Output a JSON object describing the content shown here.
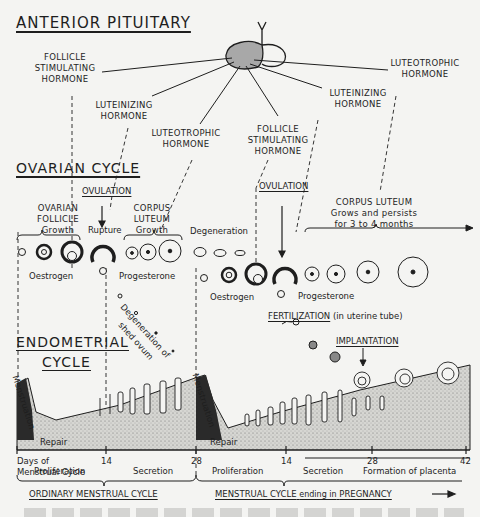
{
  "titles": {
    "anterior_pituitary": "ANTERIOR PITUITARY",
    "ovarian_cycle": "OVARIAN CYCLE",
    "endometrial_cycle_line1": "ENDOMETRIAL",
    "endometrial_cycle_line2": "CYCLE"
  },
  "hormones": {
    "fsh_1": [
      "FOLLICLE",
      "STIMULATING",
      "HORMONE"
    ],
    "lh_1": [
      "LUTEINIZING",
      "HORMONE"
    ],
    "ltr_1": [
      "LUTEOTROPHIC",
      "HORMONE"
    ],
    "fsh_2": [
      "FOLLICLE",
      "STIMULATING",
      "HORMONE"
    ],
    "lh_2": [
      "LUTEINIZING",
      "HORMONE"
    ],
    "ltr_2": [
      "LUTEOTROPHIC",
      "HORMONE"
    ]
  },
  "ovarian": {
    "ovulation_1": "OVULATION",
    "ovulation_2": "OVULATION",
    "ovarian_follicle": [
      "OVARIAN",
      "FOLLICLE"
    ],
    "growth_1": "Growth",
    "rupture": "Rupture",
    "corpus_luteum": [
      "CORPUS",
      "LUTEUM"
    ],
    "growth_2": "Growth",
    "degeneration": "Degeneration",
    "corpus_luteum_2": "CORPUS LUTEUM",
    "corpus_luteum_2_note": [
      "Grows and persists",
      "for 3 to 4 months"
    ],
    "oestrogen_1": "Oestrogen",
    "progesterone_1": "Progesterone",
    "oestrogen_2": "Oestrogen",
    "progesterone_2": "Progesterone",
    "ovum_degeneration": [
      "Degeneration of",
      "shed ovum"
    ],
    "fertilization": "FERTILIZATION",
    "fertilization_note": "(in uterine tube)",
    "implantation": "IMPLANTATION"
  },
  "endometrial": {
    "menstruation_1": "Menstruation",
    "menstruation_2": "Menstruation",
    "repair_1": "Repair",
    "repair_2": "Repair"
  },
  "axis": {
    "label": [
      "Days of",
      "Menstrual Cycle"
    ],
    "ticks": [
      "14",
      "28",
      "14",
      "28",
      "42"
    ]
  },
  "phases": {
    "proliferation_1": "Proliferation",
    "secretion_1": "Secretion",
    "proliferation_2": "Proliferation",
    "secretion_2": "Secretion",
    "placenta": "Formation of placenta"
  },
  "cycles": {
    "ordinary": "ORDINARY MENSTRUAL CYCLE",
    "pregnancy_prefix": "MENSTRUAL CYCLE",
    "pregnancy_mid": "ending in",
    "pregnancy_suffix": "PREGNANCY"
  },
  "colors": {
    "ink": "#1e1e1e",
    "paper": "#f4f4f2",
    "pituitary_shade": "#a8a8a8",
    "stipple": "#8a8a8a"
  }
}
